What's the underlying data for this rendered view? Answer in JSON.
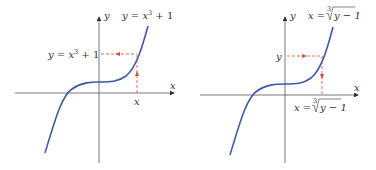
{
  "left_graph": {
    "axis_x_label": "x",
    "axis_y_label": "y",
    "curve_label_prefix": "y = x",
    "curve_label_exp": "3",
    "curve_label_suffix": " + 1",
    "y_value_label_prefix": "y = x",
    "y_value_label_exp": "3",
    "y_value_label_suffix": " + 1",
    "x_value_label": "x",
    "curve_color": "#3c5aa8",
    "dashed_color": "#e04a3a"
  },
  "right_graph": {
    "axis_x_label": "x",
    "axis_y_label": "y",
    "curve_label_prefix": "x = ",
    "curve_label_root_index": "3",
    "curve_label_radicand": "y − 1",
    "y_value_label": "y",
    "x_value_label_prefix": "x = ",
    "x_value_label_root_index": "3",
    "x_value_label_radicand": "y − 1",
    "curve_color": "#3c5aa8",
    "dashed_color": "#e04a3a"
  }
}
